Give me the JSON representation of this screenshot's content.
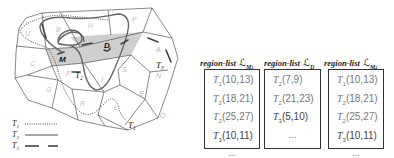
{
  "map": {
    "region_labels": [
      "U",
      "B",
      "H",
      "P",
      "C",
      "M",
      "D",
      "A",
      "F",
      "S",
      "I",
      "N",
      "G",
      "R",
      "E",
      "L",
      "O"
    ],
    "trajectory_labels": {
      "t1": "T1",
      "t3": "T3",
      "t2": "T2"
    },
    "highlighted_regions": [
      "M",
      "D"
    ],
    "region_shade_color": "#cfcfcf"
  },
  "legend": [
    {
      "trajectory": "T",
      "sub": "1",
      "style": "dotted"
    },
    {
      "trajectory": "T",
      "sub": "2",
      "style": "solid"
    },
    {
      "trajectory": "T",
      "sub": "3",
      "style": "dashed"
    }
  ],
  "region_lists": [
    {
      "title": "region-list",
      "symbol": "ℒ",
      "sub": "M1",
      "entries": [
        {
          "t": "T",
          "sub": "1",
          "range": "(10,13)"
        },
        {
          "t": "T",
          "sub": "2",
          "range": "(18,21)"
        },
        {
          "t": "T",
          "sub": "2",
          "range": "(25,27)"
        },
        {
          "t": "T",
          "sub": "3",
          "range": "(10,11)"
        }
      ],
      "more": "..."
    },
    {
      "title": "region-list",
      "symbol": "ℒ",
      "sub": "D",
      "entries": [
        {
          "t": "T",
          "sub": "2",
          "range": "(7,9)"
        },
        {
          "t": "T",
          "sub": "2",
          "range": "(21,23)"
        },
        {
          "t": "T",
          "sub": "3",
          "range": "(5,10)"
        }
      ],
      "more": "..."
    },
    {
      "title": "region-list",
      "symbol": "ℒ",
      "sub": "M2",
      "entries": [
        {
          "t": "T",
          "sub": "1",
          "range": "(10,13)"
        },
        {
          "t": "T",
          "sub": "2",
          "range": "(18,21)"
        },
        {
          "t": "T",
          "sub": "2",
          "range": "(25,27)"
        },
        {
          "t": "T",
          "sub": "3",
          "range": "(10,11)"
        }
      ],
      "more": "..."
    }
  ]
}
